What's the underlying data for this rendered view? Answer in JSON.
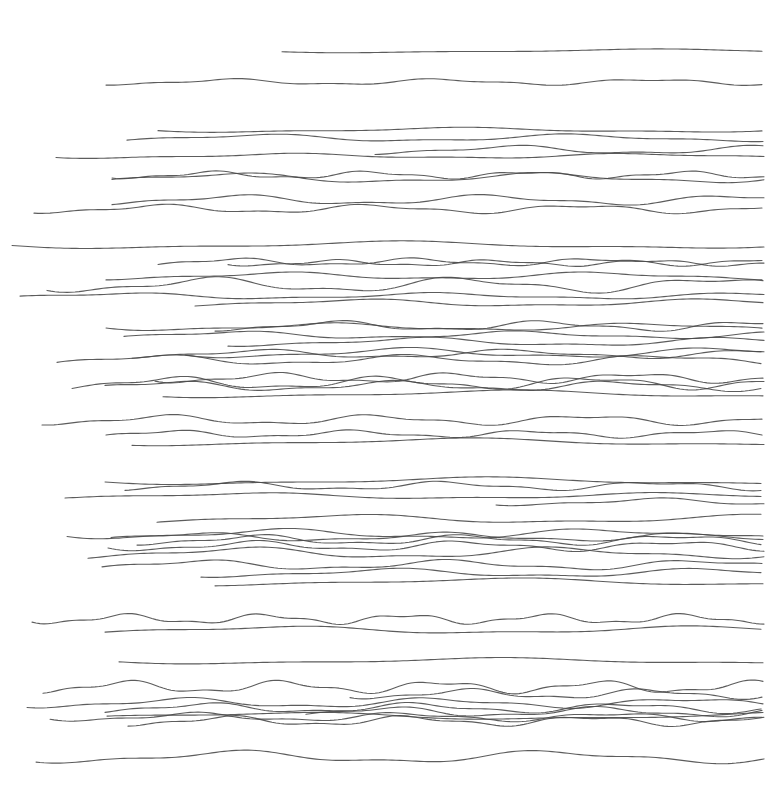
{
  "artwork": {
    "background": "#ffffff",
    "stroke_color": "#4a4a4a",
    "width": 766,
    "height": 806,
    "lines": [
      {
        "x0": 282,
        "y": 51,
        "amp": 1.5,
        "freq": 0.012,
        "phase": 0.3
      },
      {
        "x0": 106,
        "y": 82,
        "amp": 2.5,
        "freq": 0.03,
        "phase": 1.0
      },
      {
        "x0": 158,
        "y": 130,
        "amp": 2,
        "freq": 0.015,
        "phase": 0.2
      },
      {
        "x0": 127,
        "y": 138,
        "amp": 3,
        "freq": 0.02,
        "phase": 2.1
      },
      {
        "x0": 56,
        "y": 156,
        "amp": 2,
        "freq": 0.018,
        "phase": 0.5
      },
      {
        "x0": 375,
        "y": 150,
        "amp": 3.5,
        "freq": 0.025,
        "phase": 1.3
      },
      {
        "x0": 112,
        "y": 175,
        "amp": 3,
        "freq": 0.04,
        "phase": 0.7
      },
      {
        "x0": 112,
        "y": 178,
        "amp": 4,
        "freq": 0.02,
        "phase": 2.4
      },
      {
        "x0": 112,
        "y": 200,
        "amp": 4,
        "freq": 0.025,
        "phase": 1.6
      },
      {
        "x0": 34,
        "y": 209,
        "amp": 3.5,
        "freq": 0.03,
        "phase": 0.9
      },
      {
        "x0": 12,
        "y": 245,
        "amp": 3,
        "freq": 0.012,
        "phase": 0.1
      },
      {
        "x0": 158,
        "y": 262,
        "amp": 3,
        "freq": 0.035,
        "phase": 2.0
      },
      {
        "x0": 228,
        "y": 263,
        "amp": 2.5,
        "freq": 0.04,
        "phase": 0.4
      },
      {
        "x0": 106,
        "y": 276,
        "amp": 3,
        "freq": 0.02,
        "phase": 1.2
      },
      {
        "x0": 47,
        "y": 285,
        "amp": 6,
        "freq": 0.025,
        "phase": 0.6
      },
      {
        "x0": 20,
        "y": 296,
        "amp": 2.5,
        "freq": 0.02,
        "phase": 2.7
      },
      {
        "x0": 195,
        "y": 303,
        "amp": 3,
        "freq": 0.018,
        "phase": 1.8
      },
      {
        "x0": 106,
        "y": 327,
        "amp": 3,
        "freq": 0.02,
        "phase": 0.2
      },
      {
        "x0": 215,
        "y": 326,
        "amp": 4,
        "freq": 0.03,
        "phase": 1.1
      },
      {
        "x0": 124,
        "y": 335,
        "amp": 3,
        "freq": 0.022,
        "phase": 2.3
      },
      {
        "x0": 228,
        "y": 342,
        "amp": 3.5,
        "freq": 0.02,
        "phase": 0.9
      },
      {
        "x0": 132,
        "y": 354,
        "amp": 3.5,
        "freq": 0.025,
        "phase": 1.5
      },
      {
        "x0": 185,
        "y": 353,
        "amp": 4,
        "freq": 0.02,
        "phase": 0.3
      },
      {
        "x0": 57,
        "y": 360,
        "amp": 4,
        "freq": 0.025,
        "phase": 2.2
      },
      {
        "x0": 155,
        "y": 378,
        "amp": 4,
        "freq": 0.035,
        "phase": 0.5
      },
      {
        "x0": 72,
        "y": 383,
        "amp": 5,
        "freq": 0.03,
        "phase": 1.7
      },
      {
        "x0": 105,
        "y": 386,
        "amp": 4,
        "freq": 0.028,
        "phase": 2.9
      },
      {
        "x0": 163,
        "y": 394,
        "amp": 3,
        "freq": 0.012,
        "phase": 0.6
      },
      {
        "x0": 42,
        "y": 420,
        "amp": 4,
        "freq": 0.03,
        "phase": 1.0
      },
      {
        "x0": 106,
        "y": 434,
        "amp": 3,
        "freq": 0.035,
        "phase": 2.4
      },
      {
        "x0": 132,
        "y": 442,
        "amp": 3,
        "freq": 0.012,
        "phase": 0.8
      },
      {
        "x0": 105,
        "y": 481,
        "amp": 3,
        "freq": 0.012,
        "phase": 0.2
      },
      {
        "x0": 125,
        "y": 486,
        "amp": 3.5,
        "freq": 0.03,
        "phase": 1.4
      },
      {
        "x0": 65,
        "y": 496,
        "amp": 2.5,
        "freq": 0.015,
        "phase": 2.0
      },
      {
        "x0": 496,
        "y": 502,
        "amp": 3,
        "freq": 0.025,
        "phase": 0.7
      },
      {
        "x0": 157,
        "y": 519,
        "amp": 3.5,
        "freq": 0.015,
        "phase": 1.9
      },
      {
        "x0": 67,
        "y": 534,
        "amp": 4,
        "freq": 0.02,
        "phase": 0.4
      },
      {
        "x0": 111,
        "y": 537,
        "amp": 3.5,
        "freq": 0.025,
        "phase": 2.6
      },
      {
        "x0": 137,
        "y": 540,
        "amp": 4,
        "freq": 0.03,
        "phase": 1.1
      },
      {
        "x0": 108,
        "y": 546,
        "amp": 4,
        "freq": 0.03,
        "phase": 0.3
      },
      {
        "x0": 88,
        "y": 553,
        "amp": 4.5,
        "freq": 0.02,
        "phase": 1.6
      },
      {
        "x0": 102,
        "y": 565,
        "amp": 4,
        "freq": 0.025,
        "phase": 2.3
      },
      {
        "x0": 201,
        "y": 573,
        "amp": 3.5,
        "freq": 0.02,
        "phase": 0.9
      },
      {
        "x0": 215,
        "y": 582,
        "amp": 3,
        "freq": 0.012,
        "phase": 1.3
      },
      {
        "x0": 32,
        "y": 619,
        "amp": 4,
        "freq": 0.045,
        "phase": 0.5
      },
      {
        "x0": 105,
        "y": 630,
        "amp": 3,
        "freq": 0.015,
        "phase": 2.1
      },
      {
        "x0": 119,
        "y": 661,
        "amp": 2.5,
        "freq": 0.012,
        "phase": 0.2
      },
      {
        "x0": 43,
        "y": 687,
        "amp": 5,
        "freq": 0.04,
        "phase": 1.4
      },
      {
        "x0": 350,
        "y": 694,
        "amp": 4,
        "freq": 0.035,
        "phase": 0.6
      },
      {
        "x0": 107,
        "y": 716,
        "amp": 3,
        "freq": 0.012,
        "phase": 2.7
      },
      {
        "x0": 27,
        "y": 703,
        "amp": 4,
        "freq": 0.025,
        "phase": 0.8
      },
      {
        "x0": 105,
        "y": 708,
        "amp": 4,
        "freq": 0.03,
        "phase": 1.7
      },
      {
        "x0": 306,
        "y": 712,
        "amp": 4,
        "freq": 0.03,
        "phase": 2.2
      },
      {
        "x0": 50,
        "y": 717,
        "amp": 3.5,
        "freq": 0.03,
        "phase": 0.4
      },
      {
        "x0": 128,
        "y": 721,
        "amp": 4,
        "freq": 0.035,
        "phase": 1.2
      },
      {
        "x0": 36,
        "y": 757,
        "amp": 5,
        "freq": 0.02,
        "phase": 0.7
      }
    ]
  }
}
